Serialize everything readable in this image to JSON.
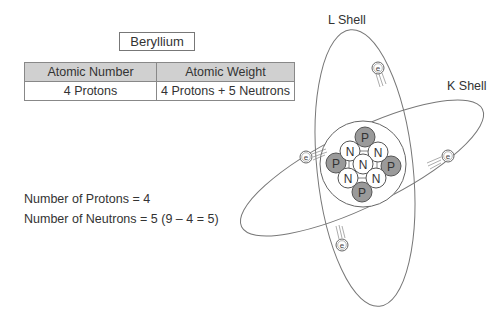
{
  "title": "Beryllium",
  "table": {
    "headers": [
      "Atomic Number",
      "Atomic Weight"
    ],
    "rows": [
      [
        "4 Protons",
        "4 Protons + 5 Neutrons"
      ]
    ]
  },
  "facts": [
    "Number of Protons = 4",
    "Number of Neutrons = 5 (9 – 4 = 5)"
  ],
  "shells": {
    "l_shell": "L Shell",
    "k_shell": "K Shell"
  },
  "nucleus": {
    "protons": [
      "P",
      "P",
      "P",
      "P"
    ],
    "neutrons": [
      "N",
      "N",
      "N",
      "N",
      "N"
    ]
  },
  "electron_label": "e",
  "colors": {
    "proton_fill": "#9a9a9a",
    "neutron_fill": "#ffffff",
    "header_fill": "#d0d0d0",
    "line": "#777777"
  }
}
